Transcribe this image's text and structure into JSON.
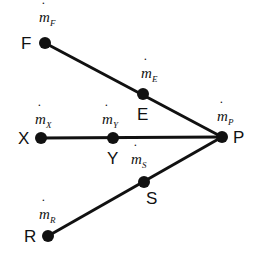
{
  "diagram": {
    "type": "network",
    "nodes": [
      {
        "id": "F",
        "label": "F",
        "x": 45,
        "y": 43,
        "flow": {
          "symbol": "m",
          "sub": "F"
        }
      },
      {
        "id": "E",
        "label": "E",
        "x": 143,
        "y": 94,
        "flow": {
          "symbol": "m",
          "sub": "E"
        }
      },
      {
        "id": "X",
        "label": "X",
        "x": 41,
        "y": 138,
        "flow": {
          "symbol": "m",
          "sub": "X"
        }
      },
      {
        "id": "Y",
        "label": "Y",
        "x": 113,
        "y": 138,
        "flow": {
          "symbol": "m",
          "sub": "Y"
        }
      },
      {
        "id": "P",
        "label": "P",
        "x": 222,
        "y": 137,
        "flow": {
          "symbol": "m",
          "sub": "P"
        }
      },
      {
        "id": "S",
        "label": "S",
        "x": 144,
        "y": 182,
        "flow": {
          "symbol": "m",
          "sub": "S"
        }
      },
      {
        "id": "R",
        "label": "R",
        "x": 48,
        "y": 236,
        "flow": {
          "symbol": "m",
          "sub": "R"
        }
      }
    ],
    "edges": [
      {
        "from": "F",
        "to": "P"
      },
      {
        "from": "X",
        "to": "P"
      },
      {
        "from": "R",
        "to": "P"
      }
    ],
    "colors": {
      "line": "#111111",
      "node": "#111111",
      "background": "#ffffff"
    }
  },
  "labels": {
    "F": "F",
    "E": "E",
    "X": "X",
    "Y": "Y",
    "P": "P",
    "S": "S",
    "R": "R",
    "m": "m",
    "subF": "F",
    "subE": "E",
    "subX": "X",
    "subY": "Y",
    "subP": "P",
    "subS": "S",
    "subR": "R",
    "dot": "˙"
  }
}
